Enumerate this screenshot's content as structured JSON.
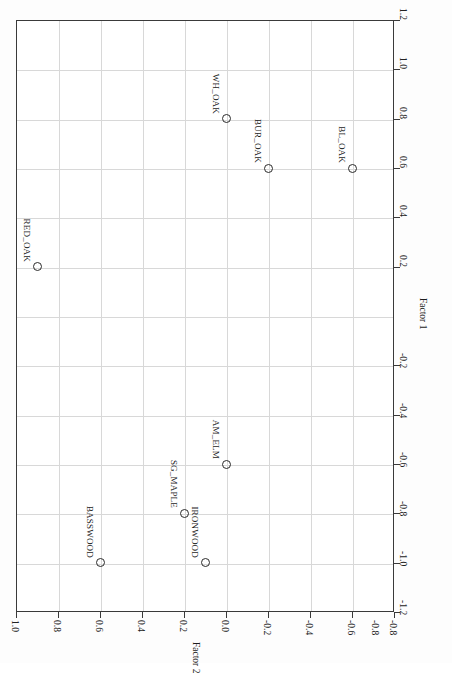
{
  "chart_data": {
    "type": "scatter",
    "title": "",
    "xlabel": "Factor 1",
    "ylabel": "Factor 2",
    "xlim": [
      -1.2,
      1.2
    ],
    "ylim": [
      -0.8,
      1.0
    ],
    "grid": true,
    "legend": "none",
    "orientation": "rotated-90-clockwise",
    "xticks": [
      "1.2",
      "1.0",
      "0.8",
      "0.6",
      "0.4",
      "0.2",
      "-0.2",
      "-0.4",
      "-0.6",
      "-0.8",
      "-1.0",
      "-1.2"
    ],
    "xtick_values": [
      1.2,
      1.0,
      0.8,
      0.6,
      0.4,
      0.2,
      -0.2,
      -0.4,
      -0.6,
      -0.8,
      -1.0,
      -1.2
    ],
    "yticks": [
      "1.0",
      "0.8",
      "0.6",
      "0.4",
      "0.2",
      "0.0",
      "-0.2",
      "-0.4",
      "-0.6",
      "-0.8"
    ],
    "ytick_values": [
      1.0,
      0.8,
      0.6,
      0.4,
      0.2,
      0.0,
      -0.2,
      -0.4,
      -0.6,
      -0.8
    ],
    "points": [
      {
        "label": "RED_OAK",
        "factor1": 0.2,
        "factor2": 0.9
      },
      {
        "label": "WH_OAK",
        "factor1": 0.8,
        "factor2": 0.0
      },
      {
        "label": "BUR_OAK",
        "factor1": 0.6,
        "factor2": -0.2
      },
      {
        "label": "BL_OAK",
        "factor1": 0.6,
        "factor2": -0.6
      },
      {
        "label": "AM_ELM",
        "factor1": -0.6,
        "factor2": 0.0
      },
      {
        "label": "SG_MAPLE",
        "factor1": -0.8,
        "factor2": 0.2
      },
      {
        "label": "BASSWOOD",
        "factor1": -1.0,
        "factor2": 0.6
      },
      {
        "label": "IRONWOOD",
        "factor1": -1.0,
        "factor2": 0.1
      }
    ]
  },
  "colors": {
    "axis": "#3a3a3a",
    "grid": "#d8d8d8",
    "marker": "#2b2b2b",
    "text": "#1c1c1c",
    "background": "#ffffff"
  }
}
